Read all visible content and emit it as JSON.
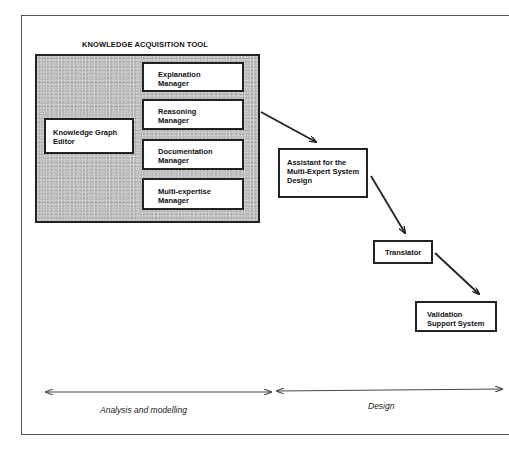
{
  "diagram": {
    "tool_title": "KNOWLEDGE ACQUISITION TOOL",
    "tool_components": {
      "knowledge_graph_editor": "Knowledge Graph\n      Editor",
      "explanation_manager": "Explanation\nManager",
      "reasoning_manager": "Reasoning\nManager",
      "documentation_manager": "Documentation\nManager",
      "multi_expertise_manager": "Multi-expertise\nManager"
    },
    "pipeline": {
      "assistant": "Assistant for the\nMulti-Expert System\nDesign",
      "translator": "Translator",
      "validation": "Validation\nSupport System"
    },
    "phases": {
      "analysis": "Analysis and modelling",
      "design": "Design"
    },
    "edges": [
      {
        "from": "knowledge-acquisition-tool",
        "to": "assistant"
      },
      {
        "from": "assistant",
        "to": "translator"
      },
      {
        "from": "translator",
        "to": "validation"
      }
    ],
    "colors": {
      "line": "#222222",
      "tool_fill": "#bdbdbd",
      "box_fill": "#ffffff"
    }
  }
}
